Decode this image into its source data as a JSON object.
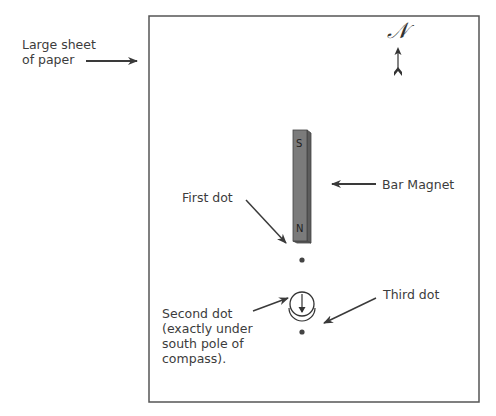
{
  "labels": {
    "paper": "Large sheet\nof paper",
    "north": "𝒩",
    "bar_magnet": "Bar Magnet",
    "first_dot": "First dot",
    "second_dot": "Second dot\n(exactly under\nsouth pole of\ncompass).",
    "third_dot": "Third dot"
  },
  "magnet": {
    "south_pole": "S",
    "north_pole": "N",
    "color": "#7b7b7b"
  },
  "colors": {
    "line": "#3a3a3a",
    "paper_border": "#555555",
    "dot": "#444444"
  }
}
